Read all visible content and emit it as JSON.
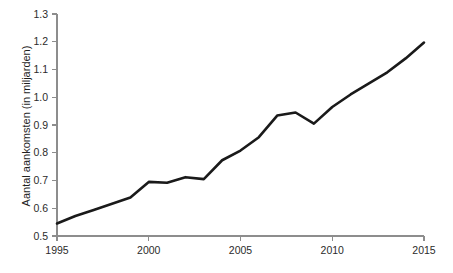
{
  "chart_data": {
    "type": "line",
    "title": "",
    "xlabel": "",
    "ylabel": "Aantal aankomsten (in miljarden)",
    "xlim": [
      1995,
      2015
    ],
    "ylim": [
      0.5,
      1.3
    ],
    "grid": false,
    "legend": null,
    "line_color": "#1a1a1a",
    "axis_color": "#8d8d8d",
    "background": "#ffffff",
    "x_ticks": [
      1995,
      2000,
      2005,
      2010,
      2015
    ],
    "x_tick_labels": [
      "1995",
      "2000",
      "2005",
      "2010",
      "2015"
    ],
    "y_ticks": [
      0.5,
      0.6,
      0.7,
      0.8,
      0.9,
      1.0,
      1.1,
      1.2,
      1.3
    ],
    "y_tick_labels": [
      "0.5",
      "0.6",
      "0.7",
      "0.8",
      "0.9",
      "1.0",
      "1.1",
      "1.2",
      "1.3"
    ],
    "x": [
      1995,
      1996,
      1997,
      1998,
      1999,
      2000,
      2001,
      2002,
      2003,
      2004,
      2005,
      2006,
      2007,
      2008,
      2009,
      2010,
      2011,
      2012,
      2013,
      2014,
      2015
    ],
    "values": [
      0.545,
      0.572,
      0.594,
      0.616,
      0.639,
      0.695,
      0.692,
      0.712,
      0.705,
      0.773,
      0.808,
      0.856,
      0.934,
      0.945,
      0.905,
      0.965,
      1.01,
      1.05,
      1.09,
      1.14,
      1.197
    ],
    "series": [
      {
        "name": "Aantal aankomsten",
        "values": [
          0.545,
          0.572,
          0.594,
          0.616,
          0.639,
          0.695,
          0.692,
          0.712,
          0.705,
          0.773,
          0.808,
          0.856,
          0.934,
          0.945,
          0.905,
          0.965,
          1.01,
          1.05,
          1.09,
          1.14,
          1.197
        ]
      }
    ]
  },
  "plot_geometry": {
    "left": 57,
    "right": 424,
    "top": 14,
    "bottom": 236,
    "tick_len": 5
  }
}
